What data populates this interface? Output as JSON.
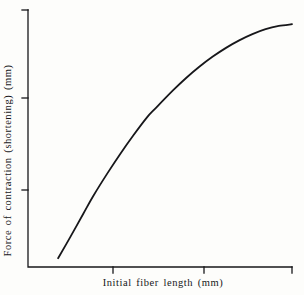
{
  "figure": {
    "background_color": "#fdfdfb",
    "ink_color": "#17171a"
  },
  "chart_data": {
    "type": "line",
    "title": "",
    "subtitle": "",
    "xlabel": "Initial fiber length (mm)",
    "ylabel": "Force of contraction (shortening) (mm)",
    "legend": [],
    "grid": false,
    "annotations": [],
    "axes": {
      "spines": [
        "left",
        "bottom"
      ],
      "tick_direction": "out",
      "x_tick_labels": [],
      "y_tick_labels": [],
      "x_tick_count": 3,
      "y_tick_count": 3,
      "xlim": [
        0,
        100
      ],
      "ylim": [
        0,
        100
      ]
    },
    "series": [
      {
        "name": "length-tension curve",
        "color": "#17171a",
        "line_width": 1.8,
        "x": [
          11.4,
          16.0,
          21.0,
          25.0,
          30.0,
          35.0,
          40.0,
          45.0,
          48.1,
          55.0,
          60.0,
          65.0,
          70.0,
          75.0,
          80.0,
          85.0,
          90.0,
          95.0,
          100.0
        ],
        "y": [
          3.5,
          12.0,
          21.5,
          29.0,
          37.5,
          45.5,
          53.0,
          60.0,
          63.5,
          71.0,
          76.0,
          80.5,
          84.5,
          88.0,
          91.0,
          93.5,
          95.5,
          96.8,
          97.5
        ]
      }
    ]
  },
  "labels": {
    "x_axis": "Initial fiber length (mm)",
    "y_axis": "Force of contraction (shortening) (mm)"
  }
}
